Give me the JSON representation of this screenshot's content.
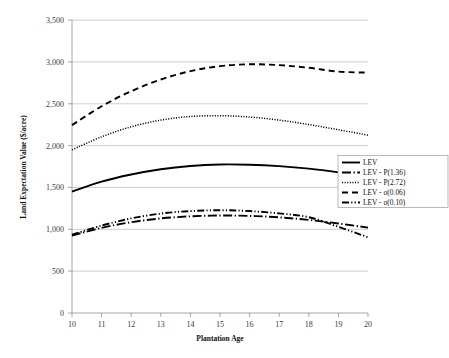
{
  "chart_data": {
    "type": "line",
    "title": "",
    "xlabel": "Plantation Age",
    "ylabel": "Land Expectation Value ($/acre)",
    "xlim": [
      10,
      20
    ],
    "ylim": [
      0,
      3500
    ],
    "xticks": [
      "10",
      "11",
      "12",
      "13",
      "14",
      "15",
      "16",
      "17",
      "18",
      "19",
      "20"
    ],
    "yticks": [
      "0",
      "500",
      "1,000",
      "1,500",
      "2,000",
      "2,500",
      "3,000",
      "3,500"
    ],
    "grid": "horizontal",
    "legend_position": "right-middle",
    "x": [
      10,
      11,
      12,
      13,
      14,
      15,
      16,
      17,
      18,
      19,
      20
    ],
    "series": [
      {
        "name": "LEV",
        "style": "solid",
        "values": [
          1450,
          1570,
          1655,
          1718,
          1757,
          1775,
          1772,
          1755,
          1725,
          1680,
          1625
        ]
      },
      {
        "name": "LEV - P(1.36)",
        "style": "long-dash-dot",
        "values": [
          925,
          1018,
          1085,
          1130,
          1155,
          1165,
          1160,
          1143,
          1112,
          1070,
          1020
        ]
      },
      {
        "name": "LEV - P(2.72)",
        "style": "dotted",
        "values": [
          1950,
          2105,
          2225,
          2305,
          2348,
          2358,
          2342,
          2305,
          2252,
          2190,
          2125
        ]
      },
      {
        "name": "LEV - σ(0.06)",
        "style": "dashed",
        "values": [
          2245,
          2470,
          2650,
          2790,
          2890,
          2950,
          2972,
          2962,
          2930,
          2885,
          2872
        ]
      },
      {
        "name": "LEV - σ(0.10)",
        "style": "dash-dot-dot",
        "values": [
          935,
          1045,
          1130,
          1188,
          1218,
          1228,
          1218,
          1190,
          1145,
          1030,
          905
        ]
      }
    ],
    "legend_entries": [
      {
        "label": "LEV",
        "style": "solid"
      },
      {
        "label": "LEV - P(1.36)",
        "style": "long-dash-dot"
      },
      {
        "label": "LEV - P(2.72)",
        "style": "dotted"
      },
      {
        "label": "LEV - σ(0.06)",
        "style": "dashed"
      },
      {
        "label": "LEV - σ(0.10)",
        "style": "dash-dot-dot"
      }
    ],
    "colors": {
      "line": "#000000",
      "grid": "#b7b7b7",
      "axis": "#8f8f8f",
      "text": "#111111"
    }
  }
}
